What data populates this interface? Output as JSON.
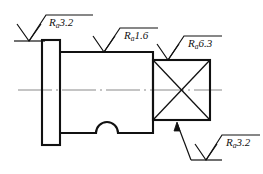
{
  "drawing": {
    "title": "Shaft part drawing with surface roughness symbols",
    "background_color": "#ffffff",
    "line_color": "#111111",
    "centerline_color": "#8a8a8a",
    "width": 263,
    "height": 174
  },
  "part": {
    "features": [
      {
        "name": "left-flange",
        "shape": "rectangle",
        "x": 42,
        "y": 40,
        "w": 18,
        "h": 105
      },
      {
        "name": "middle-cylinder",
        "shape": "rectangle",
        "x": 60,
        "y": 52,
        "w": 93,
        "h": 81
      },
      {
        "name": "bottom-groove",
        "shape": "semicircular-notch",
        "cx": 107,
        "cy": 133,
        "r": 11
      },
      {
        "name": "right-square-section",
        "shape": "square",
        "x": 153,
        "y": 60,
        "w": 57,
        "h": 60
      },
      {
        "name": "square-cross-marking",
        "shape": "diagonal-cross"
      },
      {
        "name": "center-axis",
        "shape": "dash-dot-line",
        "y": 90,
        "x1": 18,
        "x2": 222
      }
    ]
  },
  "roughness_symbols": [
    {
      "id": "ra-3-2-top-left",
      "param": "R",
      "subscript": "a",
      "value": "3.2",
      "full_text": "Ra3.2",
      "target": "left-flange-left-face",
      "position": "top-left"
    },
    {
      "id": "ra-1-6-top-middle",
      "param": "R",
      "subscript": "a",
      "value": "1.6",
      "full_text": "Ra1.6",
      "target": "middle-cylinder-top-surface",
      "position": "top-center"
    },
    {
      "id": "ra-6-3-top-right",
      "param": "R",
      "subscript": "a",
      "value": "6.3",
      "full_text": "Ra6.3",
      "target": "right-square-top-surface",
      "position": "top-right"
    },
    {
      "id": "ra-3-2-bottom-right",
      "param": "R",
      "subscript": "a",
      "value": "3.2",
      "full_text": "Ra3.2",
      "target": "right-square-section-leader",
      "position": "bottom-right"
    }
  ]
}
